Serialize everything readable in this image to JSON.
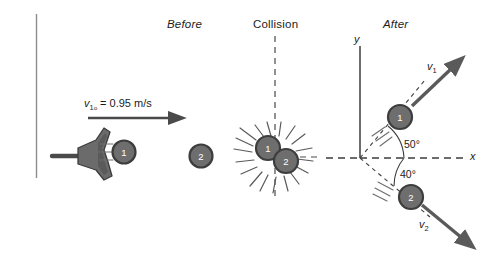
{
  "figure": {
    "background_color": "#ffffff",
    "ink_color": "#3d3d3d",
    "text_color": "#1c1c1c"
  },
  "panels": [
    {
      "id": "before",
      "label": "Before",
      "italic": true
    },
    {
      "id": "collision",
      "label": "Collision",
      "italic": false
    },
    {
      "id": "after",
      "label": "After",
      "italic": true
    }
  ],
  "before": {
    "velocity_label": {
      "symbol": "v",
      "subscript": "1",
      "subscript_o": "o",
      "equals": " = ",
      "value": "0.95",
      "units": " m/s"
    },
    "velocity_label_plain": "v1o = 0.95 m/s",
    "launcher_name": "slingshot",
    "balls": [
      {
        "number": "1",
        "fill": "#6e6e6e",
        "ring": "#3d3d3d"
      },
      {
        "number": "2",
        "fill": "#6e6e6e",
        "ring": "#3d3d3d"
      }
    ]
  },
  "collision": {
    "balls": [
      {
        "number": "1",
        "fill": "#6e6e6e",
        "ring": "#3d3d3d"
      },
      {
        "number": "2",
        "fill": "#6e6e6e",
        "ring": "#3d3d3d"
      }
    ],
    "impact_burst": "radiating impact lines"
  },
  "after": {
    "axis_x_label": "x",
    "axis_y_label": "y",
    "angle_upper": "50°",
    "angle_lower": "40°",
    "velocity_1": {
      "symbol": "v",
      "subscript": "1"
    },
    "velocity_2": {
      "symbol": "v",
      "subscript": "2"
    },
    "velocity_1_plain": "v1",
    "velocity_2_plain": "v2",
    "balls": [
      {
        "number": "1",
        "fill": "#6e6e6e",
        "ring": "#3d3d3d"
      },
      {
        "number": "2",
        "fill": "#6e6e6e",
        "ring": "#3d3d3d"
      }
    ]
  }
}
